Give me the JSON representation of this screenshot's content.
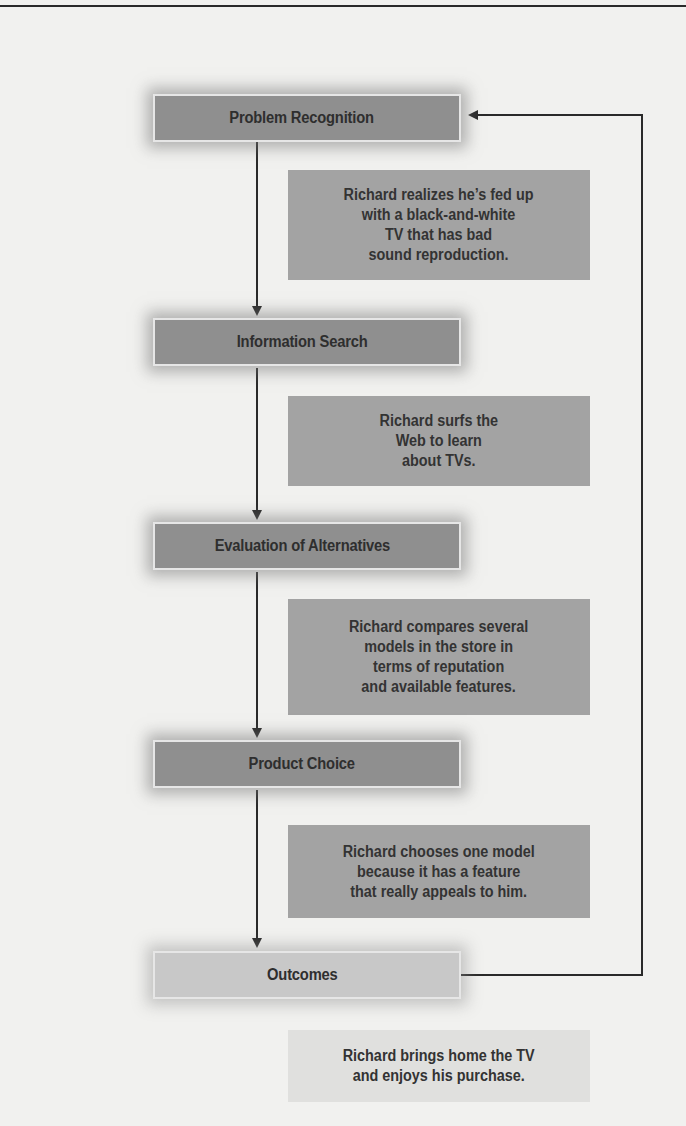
{
  "diagram": {
    "type": "consumer-decision-making-flowchart",
    "stages": [
      {
        "id": "problem-recognition",
        "label": "Problem Recognition"
      },
      {
        "id": "information-search",
        "label": "Information Search"
      },
      {
        "id": "evaluation-of-alternatives",
        "label": "Evaluation of Alternatives"
      },
      {
        "id": "product-choice",
        "label": "Product Choice"
      },
      {
        "id": "outcomes",
        "label": "Outcomes"
      }
    ],
    "examples": [
      {
        "stage": "problem-recognition",
        "text": "Richard realizes he’s fed up\nwith a black-and-white\nTV that has bad\nsound reproduction."
      },
      {
        "stage": "information-search",
        "text": "Richard surfs the\nWeb to learn\nabout TVs."
      },
      {
        "stage": "evaluation-of-alternatives",
        "text": "Richard compares several\nmodels in the store in\nterms of reputation\nand available features."
      },
      {
        "stage": "product-choice",
        "text": "Richard chooses one model\nbecause it has a feature\nthat really appeals to him."
      },
      {
        "stage": "outcomes",
        "text": "Richard brings home the TV\nand enjoys his purchase."
      }
    ],
    "edges": [
      {
        "from": "problem-recognition",
        "to": "information-search"
      },
      {
        "from": "information-search",
        "to": "evaluation-of-alternatives"
      },
      {
        "from": "evaluation-of-alternatives",
        "to": "product-choice"
      },
      {
        "from": "product-choice",
        "to": "outcomes"
      },
      {
        "from": "outcomes",
        "to": "problem-recognition",
        "kind": "feedback-loop"
      }
    ],
    "colors": {
      "stage_fill": "#8f8f8f",
      "stage_fill_outcomes": "#c8c8c8",
      "example_fill": "#a3a3a3",
      "example_fill_outcomes": "#e0e0de",
      "line": "#2a2a2a",
      "page": "#f1f1ef"
    }
  }
}
